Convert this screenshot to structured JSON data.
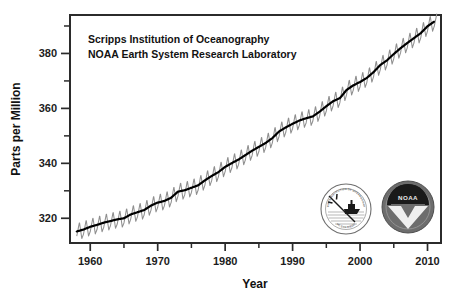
{
  "figure": {
    "background_color": "#ffffff",
    "frame_color": "#2b2b2b",
    "annotation_line_1": "Scripps Institution of Oceanography",
    "annotation_line_2": "NOAA Earth System Research Laboratory"
  },
  "logos": {
    "scripps": {
      "name": "Scripps Institution of Oceanography seal",
      "arc_top_text": "SCRIPPS INSTITUTION OF OCEANOGRAPHY",
      "arc_bottom_text": "UC SAN DIEGO"
    },
    "noaa": {
      "name": "NOAA seal",
      "center_text": "NOAA",
      "arc_top_text": "NATIONAL OCEANIC AND",
      "arc_bottom_text": "ATMOSPHERIC ADMINISTRATION",
      "fill_color": "#6d6d6d",
      "dark_color": "#1a1a1a"
    }
  },
  "chart_data": {
    "type": "line",
    "title": "",
    "xlabel": "Year",
    "ylabel": "Parts per Million",
    "xlim": [
      1957.0,
      1012.0
    ],
    "x_range": [
      1957.0,
      2012.0
    ],
    "ylim": [
      311.0,
      394.0
    ],
    "grid": false,
    "legend_position": "none",
    "x_major_ticks": [
      1960,
      1970,
      1980,
      1990,
      2000,
      2010
    ],
    "x_major_tick_labels": [
      "1960",
      "1970",
      "1980",
      "1990",
      "2000",
      "2010"
    ],
    "x_minor_ticks": [
      1965,
      1975,
      1985,
      1995,
      2005
    ],
    "y_major_ticks": [
      320,
      340,
      360,
      380
    ],
    "y_major_tick_labels": [
      "320",
      "340",
      "360",
      "380"
    ],
    "y_minor_ticks": [
      330,
      350,
      370,
      390
    ],
    "units": "ppm",
    "series": [
      {
        "name": "Monthly mean CO2 (seasonal cycle)",
        "color": "#8f8f8f",
        "style": "sawtooth-oscillation",
        "amplitude_ppm": 6.2,
        "peak_month": 5,
        "trough_month": 9
      },
      {
        "name": "Seasonally adjusted trend",
        "color": "#000000",
        "style": "smooth",
        "x": [
          1958,
          1959,
          1960,
          1961,
          1962,
          1963,
          1964,
          1965,
          1966,
          1967,
          1968,
          1969,
          1970,
          1971,
          1972,
          1973,
          1974,
          1975,
          1976,
          1977,
          1978,
          1979,
          1980,
          1981,
          1982,
          1983,
          1984,
          1985,
          1986,
          1987,
          1988,
          1989,
          1990,
          1991,
          1992,
          1993,
          1994,
          1995,
          1996,
          1997,
          1998,
          1999,
          2000,
          2001,
          2002,
          2003,
          2004,
          2005,
          2006,
          2007,
          2008,
          2009,
          2010,
          2011
        ],
        "values": [
          315.2,
          315.9,
          316.9,
          317.6,
          318.4,
          319.0,
          319.6,
          320.0,
          321.4,
          322.2,
          323.0,
          324.6,
          325.7,
          326.3,
          327.5,
          329.7,
          330.2,
          331.1,
          332.0,
          333.8,
          335.4,
          336.8,
          338.7,
          340.1,
          341.4,
          343.0,
          344.6,
          346.0,
          347.4,
          349.2,
          351.6,
          353.1,
          354.4,
          355.6,
          356.4,
          357.1,
          358.8,
          360.8,
          362.6,
          363.7,
          366.7,
          368.4,
          369.6,
          371.1,
          373.2,
          375.8,
          377.5,
          379.8,
          381.9,
          383.8,
          385.6,
          387.4,
          389.9,
          391.6
        ]
      }
    ]
  }
}
